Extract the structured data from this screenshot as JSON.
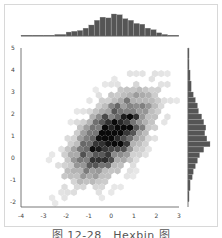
{
  "caption": "图 12-28　Hexbin 图",
  "chart_data": {
    "type": "hexbin",
    "title": "",
    "caption": "图 12-28　Hexbin 图",
    "xlabel": "",
    "ylabel": "",
    "xlim": [
      -4,
      3
    ],
    "ylim": [
      -2,
      5
    ],
    "x_ticks": [
      -4,
      -3,
      -2,
      -1,
      0,
      1,
      2,
      3
    ],
    "y_ticks": [
      -2,
      -1,
      0,
      1,
      2,
      3,
      4,
      5
    ],
    "grid": false,
    "legend": null,
    "colormap": "Greys",
    "distribution": {
      "x_mean": 0.0,
      "y_mean": 1.0,
      "x_std": 1.0,
      "y_std": 1.1,
      "correlation": 0.6
    },
    "marginal_x_histogram": {
      "bin_edges": [
        -4,
        -3.5,
        -3,
        -2.5,
        -2,
        -1.75,
        -1.5,
        -1.25,
        -1,
        -0.75,
        -0.5,
        -0.25,
        0,
        0.25,
        0.5,
        0.75,
        1,
        1.25,
        1.5,
        1.75,
        2,
        2.25,
        2.5,
        3
      ],
      "counts": [
        1,
        1,
        1,
        2,
        5,
        6,
        7,
        10,
        14,
        20,
        24,
        23,
        28,
        27,
        22,
        20,
        16,
        15,
        10,
        8,
        4,
        2,
        1
      ]
    },
    "marginal_y_histogram": {
      "bin_edges": [
        -2,
        -1.5,
        -1,
        -0.75,
        -0.5,
        -0.25,
        0,
        0.25,
        0.5,
        0.75,
        1,
        1.25,
        1.5,
        1.75,
        2,
        2.25,
        2.5,
        2.75,
        3,
        3.5,
        4,
        4.5,
        5
      ],
      "counts": [
        1,
        2,
        4,
        5,
        7,
        9,
        11,
        15,
        21,
        18,
        16,
        17,
        15,
        13,
        10,
        9,
        7,
        5,
        3,
        2,
        1,
        1
      ]
    }
  }
}
